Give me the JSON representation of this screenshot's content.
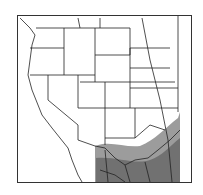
{
  "map": {
    "region": "Western North America",
    "range_colors": {
      "light": "#9a9a9a",
      "dark": "#6e6e6e"
    },
    "border_color": "#222222"
  }
}
